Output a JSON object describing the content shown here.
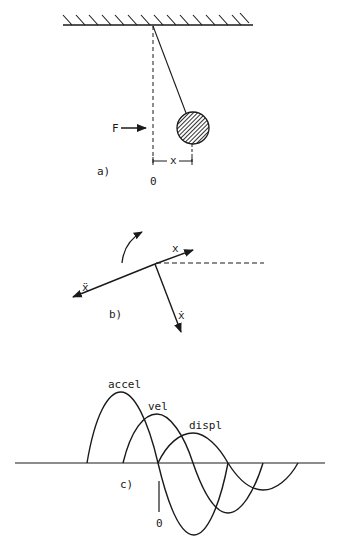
{
  "figure": {
    "colors": {
      "ink": "#1a1a1a",
      "background": "#ffffff"
    },
    "panel_a": {
      "label": "a)",
      "force_label": "F",
      "displacement_label": "x",
      "origin_label": "0",
      "elements": [
        "ceiling-hatched",
        "pendulum-string",
        "hatched-bob",
        "vertical-dashed-reference",
        "force-arrow",
        "displacement-dimension"
      ]
    },
    "panel_b": {
      "label": "b)",
      "vector_x_label": "x",
      "vector_xdot_label": "ẋ",
      "vector_xddot_label": "ẍ",
      "elements": [
        "rotation-arrow",
        "x-vector",
        "xdot-vector",
        "xddot-vector",
        "horizontal-dashed-reference"
      ]
    },
    "panel_c": {
      "label": "c)",
      "origin_label": "0",
      "curves": [
        {
          "name": "accel",
          "label": "accel"
        },
        {
          "name": "vel",
          "label": "vel"
        },
        {
          "name": "displ",
          "label": "displ"
        }
      ]
    }
  }
}
